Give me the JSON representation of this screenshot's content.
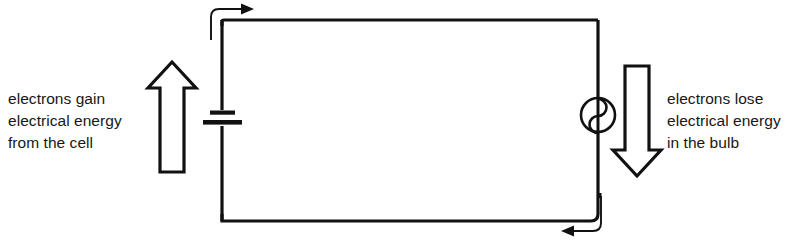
{
  "diagram": {
    "type": "circuit-energy-diagram",
    "colors": {
      "wire": "#111111",
      "text": "#171717",
      "arrow_outline": "#111111",
      "arrow_fill": "#ffffff",
      "background": "#ffffff"
    },
    "captions": {
      "left": {
        "lines": [
          "electrons gain",
          "electrical energy",
          "from the cell"
        ],
        "line1": "electrons gain",
        "line2": "electrical energy",
        "line3": "from the cell"
      },
      "right": {
        "lines": [
          "electrons lose",
          "electrical energy",
          "in the bulb"
        ],
        "line1": "electrons lose",
        "line2": "electrical energy",
        "line3": "in the bulb"
      }
    },
    "components": {
      "cell": {
        "name": "cell",
        "position": "left-wire"
      },
      "bulb": {
        "name": "bulb",
        "position": "right-wire"
      }
    },
    "energy_arrows": {
      "left": {
        "name": "energy-gain-arrow",
        "direction": "up"
      },
      "right": {
        "name": "energy-loss-arrow",
        "direction": "down"
      }
    },
    "current_arrows": {
      "top": {
        "name": "current-arrow-top",
        "direction": "right"
      },
      "bottom": {
        "name": "current-arrow-bottom",
        "direction": "left"
      }
    }
  }
}
